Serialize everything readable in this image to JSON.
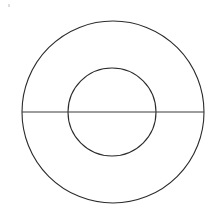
{
  "figure": {
    "background_color": "#ffffff",
    "stroke_color": "#2b2b2b",
    "line_color": "#3a3a3a",
    "canvas": {
      "width": 214,
      "height": 222
    },
    "shapes": {
      "outer_circle": {
        "name": "outer-circle",
        "cx": 113,
        "cy": 112,
        "r": 91,
        "stroke_width": 1.1,
        "fill": "none"
      },
      "inner_circle": {
        "name": "inner-circle",
        "cx": 112,
        "cy": 112,
        "r": 44,
        "stroke_width": 1.1,
        "fill": "none"
      },
      "diameter_line": {
        "name": "horizontal-diameter-line",
        "x1": 22,
        "y1": 112,
        "x2": 204,
        "y2": 112,
        "stroke_width": 1.2
      }
    },
    "artifact": {
      "name": "scan-speck",
      "x": 8,
      "y": 4
    }
  }
}
